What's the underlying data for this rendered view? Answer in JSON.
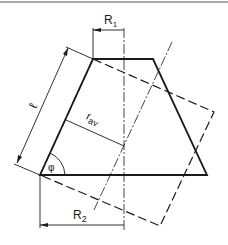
{
  "figure": {
    "type": "technical-drawing",
    "colors": {
      "line": "#1a1a1a",
      "background": "#ffffff",
      "border": "#555555"
    }
  },
  "labels": {
    "R1": "R",
    "R1_sub": "1",
    "R2": "R",
    "R2_sub": "2",
    "rav": "r",
    "rav_sub": "av",
    "length": "ℓ",
    "angle": "φ"
  },
  "geometry": {
    "trapezoid": {
      "top_left": [
        93,
        59
      ],
      "top_right": [
        153,
        59
      ],
      "bottom_right": [
        207,
        175
      ],
      "bottom_left": [
        40,
        175
      ]
    },
    "dashed_rectangle": [
      [
        93,
        59
      ],
      [
        214,
        112
      ],
      [
        160,
        226
      ],
      [
        40,
        175
      ]
    ],
    "vertical_axis_x": 124,
    "tilted_axis": [
      [
        172,
        42
      ],
      [
        94,
        210
      ]
    ]
  }
}
